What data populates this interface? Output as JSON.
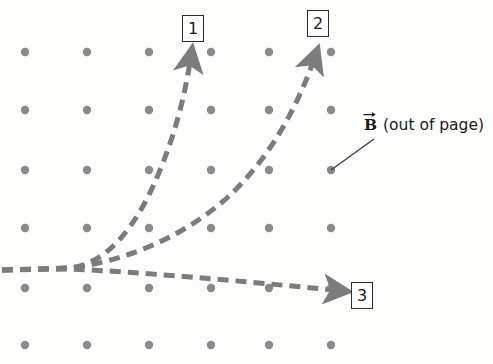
{
  "figure": {
    "width": 493,
    "height": 364,
    "background_color": "#fdfdfc"
  },
  "colors": {
    "dot": "#8a8a8a",
    "dash": "#7c7c7c",
    "text": "#1a1a1a",
    "box_border": "#2b2b2b",
    "leader_line": "#3a3a3a"
  },
  "field": {
    "symbol": "B",
    "vector_arrow": true,
    "annotation": "(out of page)",
    "leader_from_dot": [
      331,
      170
    ],
    "leader_to": [
      374,
      139
    ]
  },
  "dot_grid": {
    "columns_x": [
      25,
      87,
      149,
      211,
      269,
      331
    ],
    "rows_y": [
      52,
      110,
      170,
      228,
      288,
      345
    ],
    "radius": 4.2,
    "count": 36
  },
  "trajectories": [
    {
      "id": "1",
      "label": "1",
      "description": "steeply curving path bending upward, exits top",
      "path": "M 2,270 L 70,268 C 105,264 135,230 158,175 C 174,137 184,100 190,62",
      "arrow_tip": [
        191,
        47
      ],
      "arrow_angle_deg": -88
    },
    {
      "id": "2",
      "label": "2",
      "description": "gently curving path bending upward-right, exits top right",
      "path": "M 2,270 L 70,268 C 120,262 180,240 228,197 C 268,160 296,110 313,62",
      "arrow_tip": [
        319,
        48
      ],
      "arrow_angle_deg": -66
    },
    {
      "id": "3",
      "label": "3",
      "description": "nearly straight path drifting slightly downward to the right",
      "path": "M 2,270 L 70,269 C 140,272 240,281 334,290",
      "arrow_tip": [
        341,
        291
      ],
      "arrow_angle_deg": 8
    }
  ],
  "boxed_labels": [
    {
      "text": "1",
      "x": 182,
      "y": 15,
      "w": 22,
      "h": 27
    },
    {
      "text": "2",
      "x": 307,
      "y": 10,
      "w": 22,
      "h": 27
    },
    {
      "text": "3",
      "x": 351,
      "y": 282,
      "w": 22,
      "h": 27
    }
  ]
}
